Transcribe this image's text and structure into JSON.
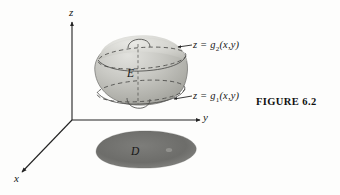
{
  "figure": {
    "caption": "FIGURE 6.2",
    "axes": {
      "z_label": "z",
      "y_label": "y",
      "x_label": "x"
    },
    "regions": {
      "solid_label": "E",
      "projection_label": "D"
    },
    "annotations": {
      "upper_surface": "z = g",
      "upper_surface_sub": "2",
      "upper_surface_args": "(x,y)",
      "lower_surface": "z = g",
      "lower_surface_sub": "1",
      "lower_surface_args": "(x,y)"
    },
    "colors": {
      "ink": "#171717",
      "solid_fill": "#b9b9b4",
      "solid_fill_light": "#d6d6d1",
      "shadow_fill": "#6f6f6c",
      "background": "#fdfdfc"
    }
  }
}
